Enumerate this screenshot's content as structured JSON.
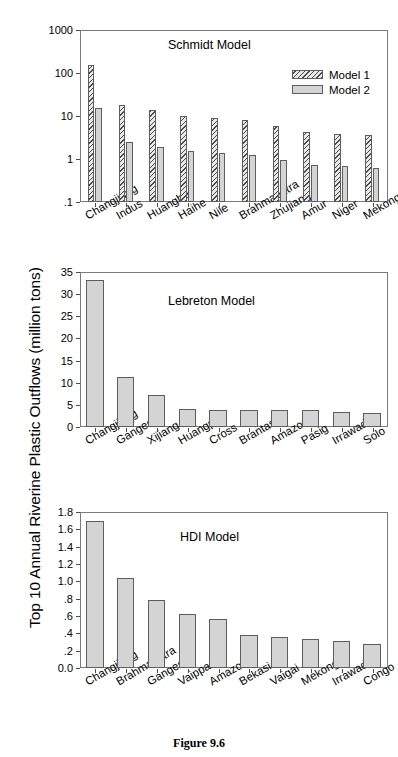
{
  "figure": {
    "caption": "Figure 9.6",
    "ylabel": "Top 10 Annual Riverine Plastic Outflows (million tons)"
  },
  "chart_data": [
    {
      "type": "bar",
      "title": "Schmidt Model",
      "xlabel": "",
      "ylabel": "Top 10 Annual Riverine Plastic Outflows (million tons)",
      "yscale": "log",
      "ylim": [
        0.1,
        1000
      ],
      "yticks": [
        0.1,
        1,
        10,
        100,
        1000
      ],
      "ytick_labels": [
        ".1",
        "1",
        "10",
        "100",
        "1000"
      ],
      "grid": false,
      "legend_position": "upper right",
      "categories": [
        "Changjiang",
        "Indus",
        "Huanghe",
        "Haihe",
        "Nile",
        "Brahmaputra",
        "Zhujiang",
        "Amur",
        "Niger",
        "Mekong"
      ],
      "series": [
        {
          "name": "Model 1",
          "style": "hatch",
          "values": [
            150,
            18,
            13.5,
            10,
            9.2,
            8.0,
            5.7,
            4.2,
            3.9,
            3.6
          ]
        },
        {
          "name": "Model 2",
          "style": "solid",
          "values": [
            15.5,
            2.5,
            1.95,
            1.5,
            1.4,
            1.25,
            0.97,
            0.72,
            0.68,
            0.63
          ]
        }
      ]
    },
    {
      "type": "bar",
      "title": "Lebreton Model",
      "xlabel": "",
      "ylabel": "Top 10 Annual Riverine Plastic Outflows (million tons)",
      "yscale": "linear",
      "ylim": [
        0,
        35
      ],
      "yticks": [
        0,
        5,
        10,
        15,
        20,
        25,
        30,
        35
      ],
      "ytick_labels": [
        "0",
        "5",
        "10",
        "15",
        "20",
        "25",
        "30",
        "35"
      ],
      "grid": false,
      "categories": [
        "Changjiang",
        "Ganges",
        "Xijiang",
        "Huangpu",
        "Cross",
        "Brantas",
        "Amazon",
        "Pasig",
        "Irrawaddy",
        "Solo"
      ],
      "series": [
        {
          "name": "Lebreton",
          "style": "solid",
          "values": [
            33.2,
            11.4,
            7.3,
            4.1,
            3.9,
            3.85,
            3.85,
            3.8,
            3.5,
            3.25
          ]
        }
      ]
    },
    {
      "type": "bar",
      "title": "HDI Model",
      "xlabel": "",
      "ylabel": "Top 10 Annual Riverine Plastic Outflows (million tons)",
      "yscale": "linear",
      "ylim": [
        0.0,
        1.8
      ],
      "yticks": [
        0.0,
        0.2,
        0.4,
        0.6,
        0.8,
        1.0,
        1.2,
        1.4,
        1.6,
        1.8
      ],
      "ytick_labels": [
        "0.0",
        ".2",
        ".4",
        ".6",
        ".8",
        "1.0",
        "1.2",
        "1.4",
        "1.6",
        "1.8"
      ],
      "grid": false,
      "categories": [
        "Changjiang",
        "Brahmaputra",
        "Ganges",
        "Vaippar",
        "Amazon",
        "Bekasi",
        "Vaigai",
        "Mekong",
        "Irrawaddy",
        "Congo"
      ],
      "series": [
        {
          "name": "HDI",
          "style": "solid",
          "values": [
            1.7,
            1.04,
            0.79,
            0.62,
            0.57,
            0.38,
            0.355,
            0.335,
            0.315,
            0.275
          ]
        }
      ]
    }
  ]
}
